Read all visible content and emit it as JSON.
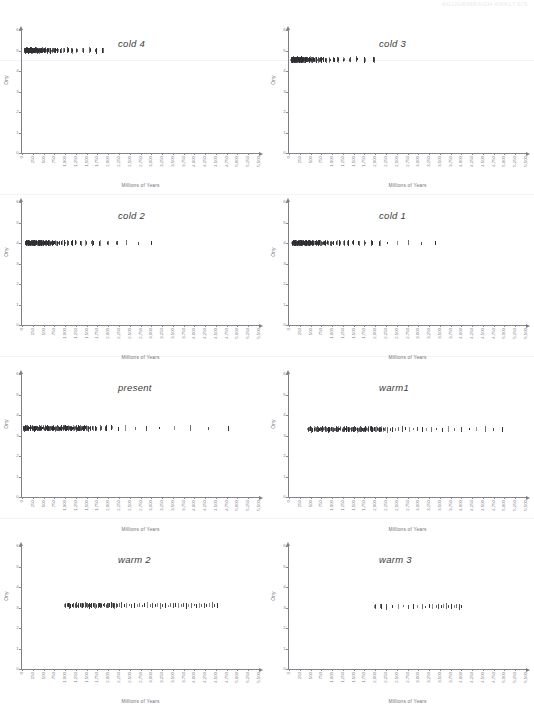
{
  "header": {
    "watermark": "AGUGRMRAGH  ANALYSIS"
  },
  "figure": {
    "panel_rows": 4,
    "panel_cols": 2,
    "axis_color": "#7e7e86",
    "mark_color": "#2f2f33"
  },
  "axes": {
    "xlabel": "Millions of Years",
    "ylabel": "Ony",
    "ylim": [
      0,
      6
    ],
    "yticks": [
      "0",
      "1",
      "2",
      "3",
      "4",
      "5",
      "6"
    ],
    "xlim": [
      0,
      5500
    ],
    "xticks": [
      "0",
      "250",
      "500",
      "750",
      "1,000",
      "1,250",
      "1,500",
      "1,750",
      "2,000",
      "2,250",
      "2,500",
      "2,750",
      "3,000",
      "3,250",
      "3,500",
      "3,750",
      "4,000",
      "4,250",
      "4,500",
      "4,750",
      "5,000",
      "5,250",
      "5,500"
    ]
  },
  "chart_data": {
    "type": "scatter",
    "title": "",
    "xlabel": "Millions of Years",
    "ylabel": "Ony",
    "xlim": [
      0,
      5500
    ],
    "ylim": [
      0,
      6
    ],
    "grid": false,
    "legend": "none",
    "panels": [
      {
        "title": "cold 4",
        "position": "row1-col1",
        "band_y": 5.0,
        "points_x": [
          40,
          52,
          60,
          66,
          74,
          80,
          86,
          92,
          100,
          108,
          118,
          126,
          132,
          140,
          148,
          156,
          164,
          172,
          180,
          188,
          196,
          206,
          214,
          222,
          232,
          240,
          252,
          262,
          272,
          284,
          296,
          308,
          320,
          336,
          352,
          368,
          384,
          400,
          420,
          440,
          460,
          480,
          500,
          520,
          545,
          570,
          600,
          640,
          690,
          740,
          800,
          880,
          960,
          1040,
          1140,
          1250,
          1400,
          1560,
          1700,
          1850
        ],
        "points_y": [
          5.0,
          5.02,
          4.98,
          5.0,
          5.01,
          4.99,
          5.0,
          5.0,
          5.02,
          4.98,
          5.0,
          5.01,
          4.99,
          5.0,
          5.0,
          5.02,
          4.98,
          5.0,
          5.01,
          4.99,
          5.0,
          5.0,
          5.02,
          4.98,
          5.0,
          5.01,
          4.99,
          5.0,
          5.0,
          5.02,
          4.98,
          5.0,
          5.01,
          4.99,
          5.0,
          5.0,
          5.02,
          4.98,
          5.0,
          5.01,
          4.99,
          5.0,
          5.0,
          5.02,
          4.98,
          5.0,
          5.01,
          4.99,
          5.0,
          5.0,
          5.02,
          4.98,
          5.0,
          5.01,
          4.99,
          5.0,
          5.0,
          5.02,
          4.98,
          5.0
        ]
      },
      {
        "title": "cold 3",
        "position": "row1-col2",
        "band_y": 4.55,
        "points_x": [
          30,
          38,
          46,
          54,
          60,
          66,
          72,
          78,
          84,
          90,
          96,
          102,
          108,
          114,
          120,
          128,
          136,
          144,
          152,
          160,
          168,
          176,
          184,
          192,
          200,
          208,
          216,
          226,
          236,
          246,
          256,
          268,
          280,
          292,
          306,
          320,
          336,
          352,
          370,
          390,
          410,
          432,
          456,
          482,
          510,
          542,
          578,
          618,
          664,
          716,
          776,
          846,
          926,
          1018,
          1124,
          1246,
          1388,
          1552,
          1740,
          1950
        ],
        "points_y": [
          4.55,
          4.57,
          4.53,
          4.55,
          4.56,
          4.54,
          4.55,
          4.55,
          4.57,
          4.53,
          4.55,
          4.56,
          4.54,
          4.55,
          4.55,
          4.57,
          4.53,
          4.55,
          4.56,
          4.54,
          4.55,
          4.55,
          4.57,
          4.53,
          4.55,
          4.56,
          4.54,
          4.55,
          4.55,
          4.57,
          4.53,
          4.55,
          4.56,
          4.54,
          4.55,
          4.55,
          4.57,
          4.53,
          4.55,
          4.56,
          4.54,
          4.55,
          4.55,
          4.57,
          4.53,
          4.55,
          4.56,
          4.54,
          4.55,
          4.55,
          4.57,
          4.53,
          4.55,
          4.56,
          4.54,
          4.55,
          4.55,
          4.57,
          4.53,
          4.55
        ]
      },
      {
        "title": "cold 2",
        "position": "row2-col1",
        "band_y": 4.0,
        "points_x": [
          60,
          72,
          84,
          96,
          108,
          120,
          132,
          144,
          156,
          168,
          180,
          192,
          204,
          216,
          228,
          240,
          252,
          264,
          276,
          288,
          300,
          312,
          324,
          336,
          348,
          362,
          376,
          390,
          404,
          418,
          432,
          448,
          464,
          480,
          498,
          516,
          536,
          558,
          582,
          608,
          636,
          668,
          704,
          744,
          790,
          842,
          900,
          966,
          1042,
          1128,
          1226,
          1338,
          1466,
          1612,
          1778,
          1966,
          2180,
          2420,
          2690,
          3000
        ],
        "points_y": [
          4.0,
          4.02,
          3.98,
          4.0,
          4.01,
          3.99,
          4.0,
          4.0,
          4.02,
          3.98,
          4.0,
          4.01,
          3.99,
          4.0,
          4.0,
          4.02,
          3.98,
          4.0,
          4.01,
          3.99,
          4.0,
          4.0,
          4.02,
          3.98,
          4.0,
          4.01,
          3.99,
          4.0,
          4.0,
          4.02,
          3.98,
          4.0,
          4.01,
          3.99,
          4.0,
          4.0,
          4.02,
          3.98,
          4.0,
          4.01,
          3.99,
          4.0,
          4.0,
          4.02,
          3.98,
          4.0,
          4.01,
          3.99,
          4.0,
          4.0,
          4.02,
          3.98,
          4.0,
          4.01,
          3.99,
          4.0,
          4.0,
          4.02,
          3.98,
          4.0
        ]
      },
      {
        "title": "cold 1",
        "position": "row2-col2",
        "band_y": 4.0,
        "points_x": [
          55,
          66,
          78,
          90,
          102,
          114,
          126,
          138,
          150,
          162,
          174,
          186,
          198,
          210,
          222,
          234,
          246,
          258,
          272,
          286,
          300,
          314,
          328,
          342,
          356,
          372,
          388,
          404,
          420,
          438,
          456,
          476,
          496,
          518,
          542,
          568,
          596,
          626,
          658,
          694,
          734,
          778,
          826,
          880,
          940,
          1006,
          1080,
          1162,
          1254,
          1356,
          1470,
          1598,
          1740,
          1900,
          2080,
          2282,
          2510,
          2766,
          3054,
          3380
        ],
        "points_y": [
          4.0,
          4.02,
          3.98,
          4.0,
          4.01,
          3.99,
          4.0,
          4.0,
          4.02,
          3.98,
          4.0,
          4.01,
          3.99,
          4.0,
          4.0,
          4.02,
          3.98,
          4.0,
          4.01,
          3.99,
          4.0,
          4.0,
          4.02,
          3.98,
          4.0,
          4.01,
          3.99,
          4.0,
          4.0,
          4.02,
          3.98,
          4.0,
          4.01,
          3.99,
          4.0,
          4.0,
          4.02,
          3.98,
          4.0,
          4.01,
          3.99,
          4.0,
          4.0,
          4.02,
          3.98,
          4.0,
          4.01,
          3.99,
          4.0,
          4.0,
          4.02,
          3.98,
          4.0,
          4.01,
          3.99,
          4.0,
          4.0,
          4.02,
          3.98,
          4.0
        ]
      },
      {
        "title": "present",
        "position": "row3-col1",
        "band_y": 3.35,
        "points_x": [
          20,
          34,
          48,
          70,
          96,
          120,
          150,
          182,
          214,
          248,
          284,
          320,
          356,
          392,
          428,
          464,
          500,
          536,
          572,
          608,
          644,
          680,
          716,
          752,
          788,
          824,
          860,
          896,
          932,
          968,
          1004,
          1040,
          1076,
          1112,
          1148,
          1184,
          1220,
          1256,
          1292,
          1328,
          1364,
          1400,
          1436,
          1472,
          1508,
          1560,
          1620,
          1700,
          1800,
          1920,
          2060,
          2220,
          2400,
          2620,
          2880,
          3180,
          3520,
          3900,
          4320,
          4780
        ],
        "points_y": [
          3.35,
          3.37,
          3.33,
          3.35,
          3.36,
          3.34,
          3.35,
          3.35,
          3.37,
          3.33,
          3.35,
          3.36,
          3.34,
          3.35,
          3.35,
          3.37,
          3.33,
          3.35,
          3.36,
          3.34,
          3.35,
          3.35,
          3.37,
          3.33,
          3.35,
          3.36,
          3.34,
          3.35,
          3.35,
          3.37,
          3.33,
          3.35,
          3.36,
          3.34,
          3.35,
          3.35,
          3.37,
          3.33,
          3.35,
          3.36,
          3.34,
          3.35,
          3.35,
          3.37,
          3.33,
          3.35,
          3.36,
          3.34,
          3.35,
          3.35,
          3.37,
          3.33,
          3.35,
          3.36,
          3.34,
          3.35,
          3.35,
          3.37,
          3.33,
          3.35
        ]
      },
      {
        "title": "warm1",
        "position": "row3-col2",
        "band_y": 3.3,
        "points_x": [
          420,
          470,
          520,
          570,
          620,
          670,
          720,
          770,
          820,
          870,
          920,
          970,
          1020,
          1070,
          1120,
          1170,
          1220,
          1270,
          1320,
          1370,
          1420,
          1470,
          1520,
          1570,
          1620,
          1670,
          1720,
          1770,
          1820,
          1870,
          1920,
          1970,
          2020,
          2070,
          2120,
          2170,
          2220,
          2280,
          2340,
          2400,
          2470,
          2540,
          2620,
          2700,
          2790,
          2880,
          2980,
          3080,
          3190,
          3300,
          3420,
          3550,
          3690,
          3840,
          4000,
          4170,
          4350,
          4540,
          4740,
          4950
        ],
        "points_y": [
          3.3,
          3.32,
          3.28,
          3.3,
          3.31,
          3.29,
          3.3,
          3.3,
          3.32,
          3.28,
          3.3,
          3.31,
          3.29,
          3.3,
          3.3,
          3.32,
          3.28,
          3.3,
          3.31,
          3.29,
          3.3,
          3.3,
          3.32,
          3.28,
          3.3,
          3.31,
          3.29,
          3.3,
          3.3,
          3.32,
          3.28,
          3.3,
          3.31,
          3.29,
          3.3,
          3.3,
          3.32,
          3.28,
          3.3,
          3.31,
          3.29,
          3.3,
          3.3,
          3.32,
          3.28,
          3.3,
          3.31,
          3.29,
          3.3,
          3.3,
          3.32,
          3.28,
          3.3,
          3.31,
          3.29,
          3.3,
          3.3,
          3.32,
          3.28,
          3.3
        ]
      },
      {
        "title": "warm 2",
        "position": "row4-col1",
        "band_y": 3.1,
        "points_x": [
          980,
          1040,
          1100,
          1160,
          1220,
          1280,
          1340,
          1400,
          1460,
          1520,
          1580,
          1640,
          1700,
          1760,
          1820,
          1880,
          1940,
          2000,
          2060,
          2120,
          2180,
          2240,
          2300,
          2360,
          2420,
          2480,
          2540,
          2600,
          2660,
          2720,
          2780,
          2840,
          2900,
          2960,
          3020,
          3080,
          3140,
          3200,
          3260,
          3320,
          3380,
          3440,
          3500,
          3560,
          3620,
          3680,
          3740,
          3800,
          3860,
          3920,
          3980,
          4040,
          4100,
          4160,
          4220,
          4280,
          4340,
          4400,
          4460,
          4520
        ],
        "points_y": [
          3.1,
          3.12,
          3.08,
          3.1,
          3.11,
          3.09,
          3.1,
          3.1,
          3.12,
          3.08,
          3.1,
          3.11,
          3.09,
          3.1,
          3.1,
          3.12,
          3.08,
          3.1,
          3.11,
          3.09,
          3.1,
          3.1,
          3.12,
          3.08,
          3.1,
          3.11,
          3.09,
          3.1,
          3.1,
          3.12,
          3.08,
          3.1,
          3.11,
          3.09,
          3.1,
          3.1,
          3.12,
          3.08,
          3.1,
          3.11,
          3.09,
          3.1,
          3.1,
          3.12,
          3.08,
          3.1,
          3.11,
          3.09,
          3.1,
          3.1,
          3.12,
          3.08,
          3.1,
          3.11,
          3.09,
          3.1,
          3.1,
          3.12,
          3.08,
          3.1
        ]
      },
      {
        "title": "warm 3",
        "position": "row4-col2",
        "band_y": 3.05,
        "points_x": [
          1980,
          2120,
          2260,
          2400,
          2520,
          2640,
          2760,
          2880,
          2980,
          3080,
          3160,
          3240,
          3320,
          3400,
          3460,
          3520,
          3580,
          3640,
          3700,
          3760,
          3820,
          3880,
          3940,
          4000
        ],
        "points_y": [
          3.05,
          3.06,
          3.04,
          3.05,
          3.05,
          3.06,
          3.04,
          3.05,
          3.05,
          3.06,
          3.04,
          3.05,
          3.05,
          3.06,
          3.04,
          3.05,
          3.05,
          3.06,
          3.04,
          3.05,
          3.05,
          3.06,
          3.04,
          3.05
        ]
      }
    ]
  }
}
